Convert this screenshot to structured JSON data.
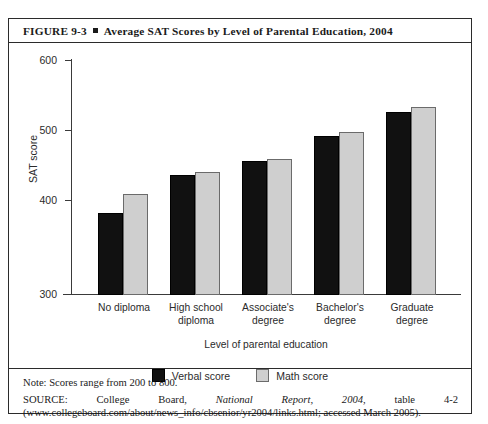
{
  "figure": {
    "label": "FIGURE 9-3",
    "title": "Average SAT Scores by Level of Parental Education, 2004"
  },
  "chart_data": {
    "type": "bar",
    "title": "Average SAT Scores by Level of Parental Education, 2004",
    "categories": [
      "No diploma",
      "High school diploma",
      "Associate's degree",
      "Bachelor's degree",
      "Graduate degree"
    ],
    "series": [
      {
        "name": "Verbal score",
        "color": "#111111",
        "values": [
          417,
          472,
          491,
          527,
          561
        ]
      },
      {
        "name": "Math score",
        "color": "#cfcfcf",
        "values": [
          445,
          476,
          494,
          533,
          568
        ]
      }
    ],
    "xlabel": "Level of parental education",
    "ylabel": "SAT score",
    "ylim": [
      300,
      620
    ],
    "yticks": [
      300,
      400,
      500,
      600
    ],
    "grid": false,
    "legend_position": "bottom"
  },
  "axes": {
    "y_title": "SAT score",
    "x_title": "Level of parental education",
    "y_ticks": [
      "600",
      "500",
      "400",
      "300"
    ]
  },
  "categories": [
    {
      "line1": "No diploma",
      "line2": ""
    },
    {
      "line1": "High school",
      "line2": "diploma"
    },
    {
      "line1": "Associate's",
      "line2": "degree"
    },
    {
      "line1": "Bachelor's",
      "line2": "degree"
    },
    {
      "line1": "Graduate",
      "line2": "degree"
    }
  ],
  "legend": [
    {
      "label": "Verbal score",
      "color": "#111111"
    },
    {
      "label": "Math score",
      "color": "#cfcfcf"
    }
  ],
  "footer": {
    "note": "Note: Scores range from 200 to 800.",
    "source_prefix": "SOURCE: College Board, ",
    "source_italic": "National Report, 2004",
    "source_suffix": ", table 4-2 (www.collegeboard.com/about/news_info/cbsenior/yr2004/links.html; accessed March 2005)."
  }
}
